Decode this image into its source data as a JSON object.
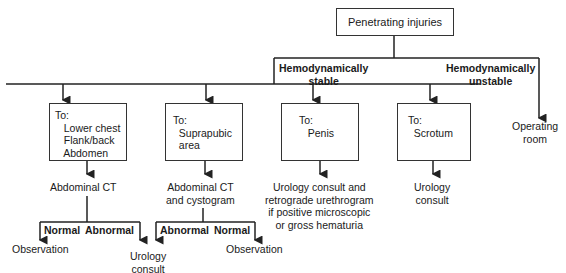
{
  "root": {
    "label": "Penetrating injuries"
  },
  "branches": {
    "stable": "Hemodynamically\nstable",
    "unstable": "Hemodynamically\nunstable"
  },
  "unstable_outcome": "Operating\nroom",
  "sites": [
    {
      "label": "To:\n   Lower chest\n   Flank/back\n   Abdomen",
      "next": "Abdominal CT"
    },
    {
      "label": "To:\n  Suprapubic\n  area",
      "next": "Abdominal CT\nand cystogram"
    },
    {
      "label": "To:\n   Penis",
      "next": "Urology consult and\nretrograde urethrogram\nif positive microscopic\nor gross hematuria"
    },
    {
      "label": "To:\n  Scrotum",
      "next": "Urology\nconsult"
    }
  ],
  "ct1": {
    "left_label": "Normal",
    "right_label": "Abnormal",
    "left_outcome": "Observation",
    "right_outcome": "Urology\nconsult"
  },
  "ct2": {
    "left_label": "Abnormal",
    "right_label": "Normal",
    "right_outcome": "Observation"
  }
}
